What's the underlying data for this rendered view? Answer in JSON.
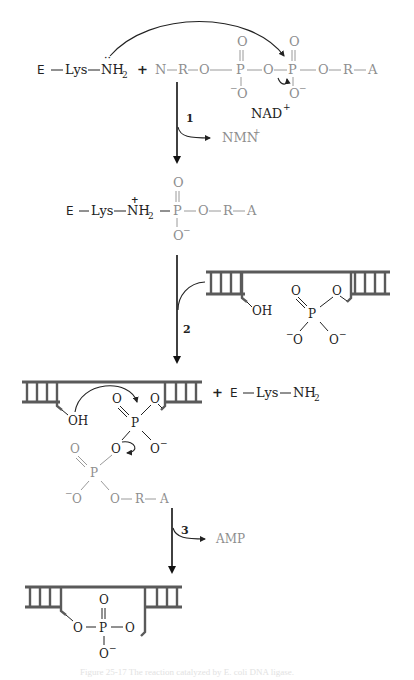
{
  "diagram": {
    "colors": {
      "reactant_black": "#222222",
      "nad_gray": "#8e8e8e",
      "dna_ladder": "#5a5a5a"
    },
    "step1": {
      "enzyme": "E",
      "lys": "Lys",
      "nh2": "NH",
      "nh2_sub": "2",
      "lone_pair": "··",
      "plus": "+",
      "nad_chain": [
        "N",
        "R",
        "O",
        "P",
        "O",
        "P",
        "O",
        "R",
        "A"
      ],
      "oxo": "O",
      "o_minus": "O",
      "minus": "−",
      "cofactor": "NAD",
      "cofactor_charge": "+",
      "step_number": "1",
      "byproduct": "NMN",
      "byproduct_charge": "+"
    },
    "intermediate1": {
      "enzyme": "E",
      "lys": "Lys",
      "nh2": "NH",
      "nh2_sub": "2",
      "charge": "+",
      "p": "P",
      "o": "O",
      "r": "R",
      "a": "A",
      "minus": "−"
    },
    "step2": {
      "step_number": "2",
      "oh": "OH",
      "p": "P",
      "o": "O",
      "minus": "−"
    },
    "intermediate2": {
      "oh": "OH",
      "p": "P",
      "o": "O",
      "r": "R",
      "a": "A",
      "minus": "−",
      "plus": "+",
      "enzyme": "E",
      "lys": "Lys",
      "nh2": "NH",
      "nh2_sub": "2"
    },
    "step3": {
      "step_number": "3",
      "byproduct": "AMP"
    },
    "product": {
      "p": "P",
      "o": "O",
      "minus": "−"
    },
    "caption": "Figure 25-17  The reaction catalyzed by E. coli DNA ligase."
  }
}
